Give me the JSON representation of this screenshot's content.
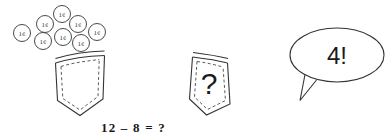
{
  "illustration": {
    "title": "coin-subtraction-word-problem",
    "colors": {
      "stroke": "#4a4a4a",
      "stroke_dark": "#333333",
      "text": "#1a1a1a",
      "background": "#ffffff"
    }
  },
  "coins": {
    "label": "1¢",
    "count": 8,
    "items": [
      {
        "label": "1¢",
        "cx": 22,
        "cy": 33,
        "r": 8.5
      },
      {
        "label": "1¢",
        "cx": 45,
        "cy": 24,
        "r": 8.5
      },
      {
        "label": "1¢",
        "cx": 62,
        "cy": 14,
        "r": 8.5
      },
      {
        "label": "1¢",
        "cx": 78,
        "cy": 24,
        "r": 8.5
      },
      {
        "label": "1¢",
        "cx": 97,
        "cy": 32,
        "r": 8.5
      },
      {
        "label": "1¢",
        "cx": 43,
        "cy": 41,
        "r": 8.5
      },
      {
        "label": "1¢",
        "cx": 63,
        "cy": 37,
        "r": 8.5
      },
      {
        "label": "1¢",
        "cx": 81,
        "cy": 43,
        "r": 8.5
      }
    ]
  },
  "pocket_left": {
    "name": "empty-pocket",
    "content": ""
  },
  "pocket_right": {
    "name": "question-pocket",
    "content": "?"
  },
  "speech_bubble": {
    "text": "4!"
  },
  "equation": {
    "text": "12 – 8 = ?",
    "operands": [
      12,
      8
    ],
    "operator": "−",
    "result": "?"
  }
}
